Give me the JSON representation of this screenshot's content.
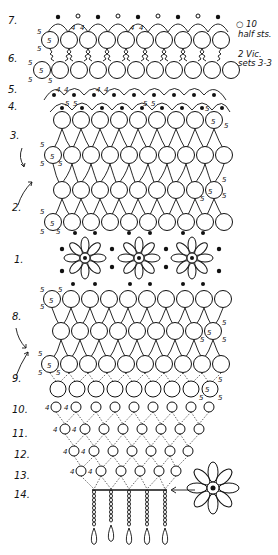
{
  "diagram": {
    "type": "tatting-pattern",
    "row_labels": [
      {
        "label": "7.",
        "y": 24
      },
      {
        "label": "6.",
        "y": 62
      },
      {
        "label": "5.",
        "y": 92
      },
      {
        "label": "4.",
        "y": 108
      },
      {
        "label": "3.",
        "y": 138
      },
      {
        "label": "2.",
        "y": 210
      },
      {
        "label": "1.",
        "y": 262
      },
      {
        "label": "8.",
        "y": 319
      },
      {
        "label": "9.",
        "y": 381
      },
      {
        "label": "10.",
        "y": 412
      },
      {
        "label": "11.",
        "y": 436
      },
      {
        "label": "12.",
        "y": 457
      },
      {
        "label": "13.",
        "y": 478
      },
      {
        "label": "14.",
        "y": 497
      }
    ],
    "legend": {
      "open_picot": "○ 10",
      "open_picot_line2": "half sts.",
      "vic_sets": "2 Vic.",
      "vic_sets_line2": "sets 3-3"
    },
    "stitch_counts": {
      "five": "5",
      "four": "4"
    }
  }
}
